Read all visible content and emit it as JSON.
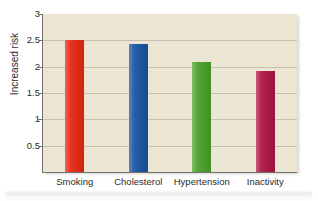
{
  "chart_data": {
    "type": "bar",
    "title": "",
    "subtitle": "",
    "xlabel": "",
    "ylabel": "Increased risk",
    "categories": [
      "Smoking",
      "Cholesterol",
      "Hypertension",
      "Inactivity"
    ],
    "values": [
      2.5,
      2.43,
      2.08,
      1.92
    ],
    "series": [
      {
        "name": "Increased risk",
        "values": [
          2.5,
          2.43,
          2.08,
          1.92
        ]
      }
    ],
    "bar_colors": [
      "#e82b15",
      "#1b57a5",
      "#4ba32b",
      "#b01847"
    ],
    "ylim": [
      0,
      3
    ],
    "xlim": [
      0,
      4
    ],
    "y_ticks": [
      0.5,
      1,
      1.5,
      2,
      2.5,
      3
    ],
    "y_tick_labels": [
      "0.5",
      "1",
      "1.5",
      "2",
      "2.5",
      "3"
    ],
    "grid": true,
    "grid_axis": "y",
    "legend": false,
    "legend_position": "none",
    "plot_background": "#ece5d4",
    "figure_background": "#ffffff",
    "gridline_color": "#c9c0ad",
    "axis_color": "#76716a",
    "text_color": "#2b2b2b",
    "annotations": []
  },
  "y_axis": {
    "title": "Increased risk",
    "ticks": [
      {
        "label": "3",
        "value": 3
      },
      {
        "label": "2.5",
        "value": 2.5
      },
      {
        "label": "2",
        "value": 2
      },
      {
        "label": "1.5",
        "value": 1.5
      },
      {
        "label": "1",
        "value": 1
      },
      {
        "label": "0.5",
        "value": 0.5
      }
    ]
  },
  "x_axis": {
    "title": "",
    "ticks": [
      {
        "label": "Smoking"
      },
      {
        "label": "Cholesterol"
      },
      {
        "label": "Hypertension"
      },
      {
        "label": "Inactivity"
      }
    ]
  },
  "bars": [
    {
      "category": "Smoking",
      "value": 2.5,
      "color": "#e82b15"
    },
    {
      "category": "Cholesterol",
      "value": 2.43,
      "color": "#1b57a5"
    },
    {
      "category": "Hypertension",
      "value": 2.08,
      "color": "#4ba32b"
    },
    {
      "category": "Inactivity",
      "value": 1.92,
      "color": "#b01847"
    }
  ]
}
